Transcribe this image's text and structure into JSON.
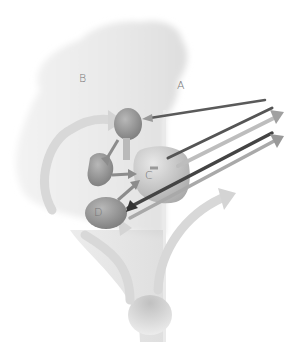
{
  "diagram": {
    "type": "anatomical-schematic",
    "labels": {
      "A": "A",
      "B": "B",
      "C": "C",
      "D": "D"
    },
    "colors": {
      "tissue_light": "#ededed",
      "tissue_mid": "#e2e2e2",
      "column": "#dcdcdc",
      "node_dark": "#8a8a8a",
      "node_mid": "#a8a8a8",
      "arrow_dark": "#555555",
      "arrow_mid": "#8c8c8c",
      "arrow_light": "#c8c8c8",
      "label": "#777777"
    },
    "nodes": [
      {
        "id": "top",
        "label": ""
      },
      {
        "id": "left",
        "label": ""
      },
      {
        "id": "C",
        "label": "C"
      },
      {
        "id": "D",
        "label": "D"
      }
    ],
    "arrows": [
      {
        "from": "right-edge",
        "to": "top",
        "shade": "dark"
      },
      {
        "from": "C",
        "to": "right-edge",
        "shade": "dark"
      },
      {
        "from": "C",
        "to": "right-edge",
        "shade": "mid"
      },
      {
        "from": "right-edge",
        "to": "D",
        "shade": "dark"
      },
      {
        "from": "D",
        "to": "right-edge",
        "shade": "mid"
      },
      {
        "from": "top",
        "to": "left",
        "shade": "mid"
      },
      {
        "from": "left",
        "to": "C",
        "shade": "mid"
      },
      {
        "from": "D",
        "to": "C",
        "shade": "mid"
      },
      {
        "from": "B-loop",
        "to": "top",
        "shade": "light"
      },
      {
        "from": "stem",
        "to": "D",
        "shade": "light"
      },
      {
        "from": "stem",
        "to": "right",
        "shade": "light"
      }
    ]
  }
}
